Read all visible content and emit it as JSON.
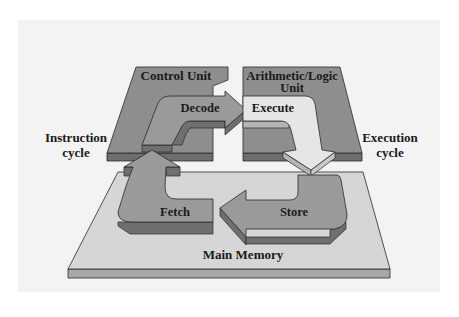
{
  "diagram": {
    "type": "machine-cycle",
    "colors": {
      "background": "#ffffff",
      "panel": "#f3f3f3",
      "unit_slab_top": "#8e8e8e",
      "unit_slab_edge": "#6e6e6e",
      "memory_slab_top": "#d6d6d6",
      "memory_slab_edge": "#a8a8a8",
      "dark_arrow_top": "#9a9a9a",
      "dark_arrow_edge": "#6f6f6f",
      "light_arrow_top": "#e6e6e6",
      "light_arrow_edge": "#b5b5b5",
      "outline": "#2a2a2a"
    },
    "nodes": {
      "control_unit": {
        "label": "Control Unit"
      },
      "alu": {
        "label_line1": "Arithmetic/Logic",
        "label_line2": "Unit"
      },
      "main_memory": {
        "label": "Main Memory"
      }
    },
    "steps": {
      "fetch": {
        "label": "Fetch"
      },
      "decode": {
        "label": "Decode"
      },
      "execute": {
        "label": "Execute"
      },
      "store": {
        "label": "Store"
      }
    },
    "side_labels": {
      "instruction_cycle": {
        "line1": "Instruction",
        "line2": "cycle"
      },
      "execution_cycle": {
        "line1": "Execution",
        "line2": "cycle"
      }
    }
  }
}
